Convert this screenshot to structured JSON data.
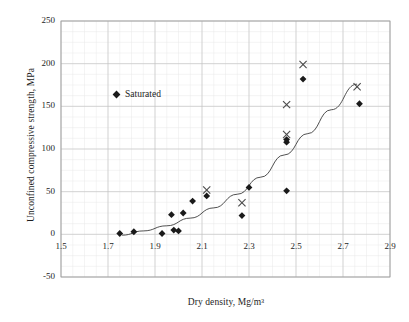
{
  "chart_data": {
    "type": "scatter",
    "title": "",
    "xlabel": "Dry density, Mg/m³",
    "ylabel": "Unconfined compressive strength, MPa",
    "xlim": [
      1.5,
      2.9
    ],
    "ylim": [
      -50,
      250
    ],
    "xticks": [
      "1.5",
      "1.7",
      "1.9",
      "2.1",
      "2.3",
      "2.5",
      "2.7",
      "2.9"
    ],
    "xtick_values": [
      1.5,
      1.7,
      1.9,
      2.1,
      2.3,
      2.5,
      2.7,
      2.9
    ],
    "yticks": [
      "250",
      "200",
      "150",
      "100",
      "50",
      "0",
      "-50"
    ],
    "ytick_values": [
      250,
      200,
      150,
      100,
      50,
      0,
      -50
    ],
    "grid": "major and minor gridlines, light gray",
    "legend": [
      {
        "label": "Saturated",
        "marker": "diamond",
        "color": "#1a1a1a"
      }
    ],
    "legend_position": "inside upper-left",
    "series": [
      {
        "name": "Saturated",
        "marker": "diamond",
        "color": "#1a1a1a",
        "points": [
          {
            "x": 1.75,
            "y": 1
          },
          {
            "x": 1.81,
            "y": 3
          },
          {
            "x": 1.93,
            "y": 1
          },
          {
            "x": 1.97,
            "y": 23
          },
          {
            "x": 1.98,
            "y": 5
          },
          {
            "x": 2.0,
            "y": 4
          },
          {
            "x": 2.02,
            "y": 25
          },
          {
            "x": 2.06,
            "y": 39
          },
          {
            "x": 2.12,
            "y": 45
          },
          {
            "x": 2.27,
            "y": 22
          },
          {
            "x": 2.3,
            "y": 55
          },
          {
            "x": 2.46,
            "y": 108
          },
          {
            "x": 2.46,
            "y": 111
          },
          {
            "x": 2.46,
            "y": 51
          },
          {
            "x": 2.53,
            "y": 182
          },
          {
            "x": 2.77,
            "y": 153
          }
        ]
      },
      {
        "name": "Unsaturated",
        "marker": "cross",
        "color": "#4a4a4a",
        "points": [
          {
            "x": 2.12,
            "y": 52
          },
          {
            "x": 2.27,
            "y": 37
          },
          {
            "x": 2.46,
            "y": 117
          },
          {
            "x": 2.46,
            "y": 152
          },
          {
            "x": 2.53,
            "y": 199
          },
          {
            "x": 2.76,
            "y": 173
          }
        ]
      }
    ],
    "trendline": {
      "type": "power-fit-curve",
      "color": "#3c3c3c",
      "points": [
        {
          "x": 1.76,
          "y": -1
        },
        {
          "x": 1.85,
          "y": 4
        },
        {
          "x": 1.95,
          "y": 10
        },
        {
          "x": 2.05,
          "y": 19
        },
        {
          "x": 2.15,
          "y": 31
        },
        {
          "x": 2.25,
          "y": 47
        },
        {
          "x": 2.35,
          "y": 67
        },
        {
          "x": 2.45,
          "y": 93
        },
        {
          "x": 2.55,
          "y": 118
        },
        {
          "x": 2.65,
          "y": 146
        },
        {
          "x": 2.76,
          "y": 176
        }
      ]
    }
  },
  "legend": {
    "saturated_label": "Saturated"
  },
  "axes": {
    "x_title": "Dry density, Mg/m³",
    "y_title": "Unconfined compressive strength, MPa"
  },
  "caption": {
    "partial_text": ""
  }
}
